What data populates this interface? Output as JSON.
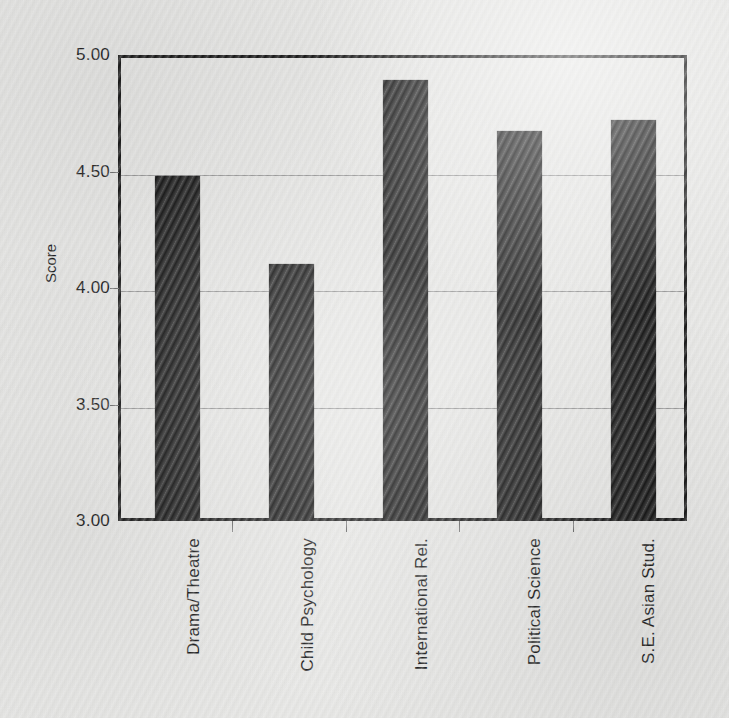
{
  "chart_data": {
    "type": "bar",
    "title": "",
    "xlabel": "",
    "ylabel": "Score",
    "ylim": [
      3.0,
      5.0
    ],
    "yticks": [
      "3.00",
      "3.50",
      "4.00",
      "4.50",
      "5.00"
    ],
    "ytick_values": [
      3.0,
      3.5,
      4.0,
      4.5,
      5.0
    ],
    "grid": "horizontal",
    "legend": "none",
    "bar_color": "#171717",
    "categories": [
      "Drama/Theatre",
      "Child Psychology",
      "International Rel.",
      "Political  Science",
      "S.E. Asian Stud."
    ],
    "values": [
      4.47,
      4.09,
      4.88,
      4.66,
      4.71
    ]
  },
  "colors": {
    "bar": "#171717",
    "axis": "#1a1a1a",
    "gridline": "#9a9a9a",
    "text": "#1a1a1a",
    "paper": "#e8e8e6"
  }
}
